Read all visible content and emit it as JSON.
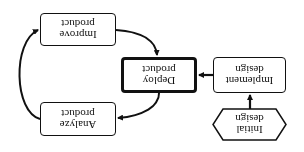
{
  "diagram": {
    "orientation": "rotated 180 degrees",
    "nodes": [
      {
        "id": "initial_design",
        "shape": "hexagon",
        "lines": [
          "Initial",
          "design"
        ]
      },
      {
        "id": "implement_design",
        "shape": "rounded-rect",
        "lines": [
          "Implement",
          "design"
        ]
      },
      {
        "id": "deploy_product",
        "shape": "rounded-rect-thick",
        "lines": [
          "Deploy",
          "product"
        ]
      },
      {
        "id": "analyze_product",
        "shape": "rounded-rect",
        "lines": [
          "Analyze",
          "product"
        ]
      },
      {
        "id": "improve_product",
        "shape": "rounded-rect",
        "lines": [
          "Improve",
          "product"
        ]
      }
    ],
    "edges": [
      {
        "from": "initial_design",
        "to": "implement_design"
      },
      {
        "from": "implement_design",
        "to": "deploy_product"
      },
      {
        "from": "deploy_product",
        "to": "analyze_product"
      },
      {
        "from": "analyze_product",
        "to": "improve_product"
      },
      {
        "from": "improve_product",
        "to": "deploy_product"
      }
    ],
    "colors": {
      "stroke": "#111111",
      "background": "#ffffff"
    }
  }
}
